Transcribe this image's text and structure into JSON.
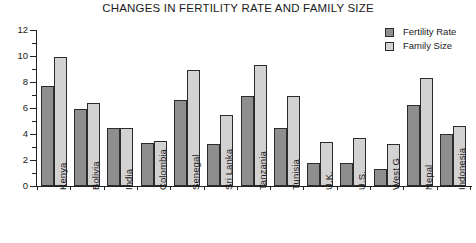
{
  "chart_data": {
    "type": "bar",
    "title": "CHANGES IN FERTILITY RATE AND FAMILY SIZE",
    "xlabel": "",
    "ylabel": "",
    "ylim": [
      0,
      12
    ],
    "ytick_step": 2,
    "yticks": [
      "0",
      "2",
      "4",
      "6",
      "8",
      "10",
      "12"
    ],
    "minor_ticks": [
      1,
      3,
      5,
      7,
      9,
      11
    ],
    "grid": false,
    "legend_position": "top-right",
    "categories": [
      "Kenya",
      "Bolivia",
      "India",
      "Colombia",
      "Senegal",
      "Sri Lanka",
      "Tanzania",
      "Tunisia",
      "U.K.",
      "U.S.",
      "West G",
      "Nepal",
      "Indonesia"
    ],
    "series": [
      {
        "name": "Fertility Rate",
        "color": "#8e8e8e",
        "values": [
          7.7,
          5.9,
          4.5,
          3.3,
          6.6,
          3.2,
          6.9,
          4.5,
          1.8,
          1.8,
          1.3,
          6.2,
          4.0
        ]
      },
      {
        "name": "Family Size",
        "color": "#d2d2d2",
        "values": [
          9.9,
          6.4,
          4.5,
          3.5,
          8.9,
          5.5,
          9.3,
          6.9,
          3.4,
          3.7,
          3.2,
          8.3,
          4.6
        ]
      }
    ]
  },
  "legend": {
    "items": [
      {
        "label": "Fertility Rate"
      },
      {
        "label": "Family Size"
      }
    ]
  }
}
